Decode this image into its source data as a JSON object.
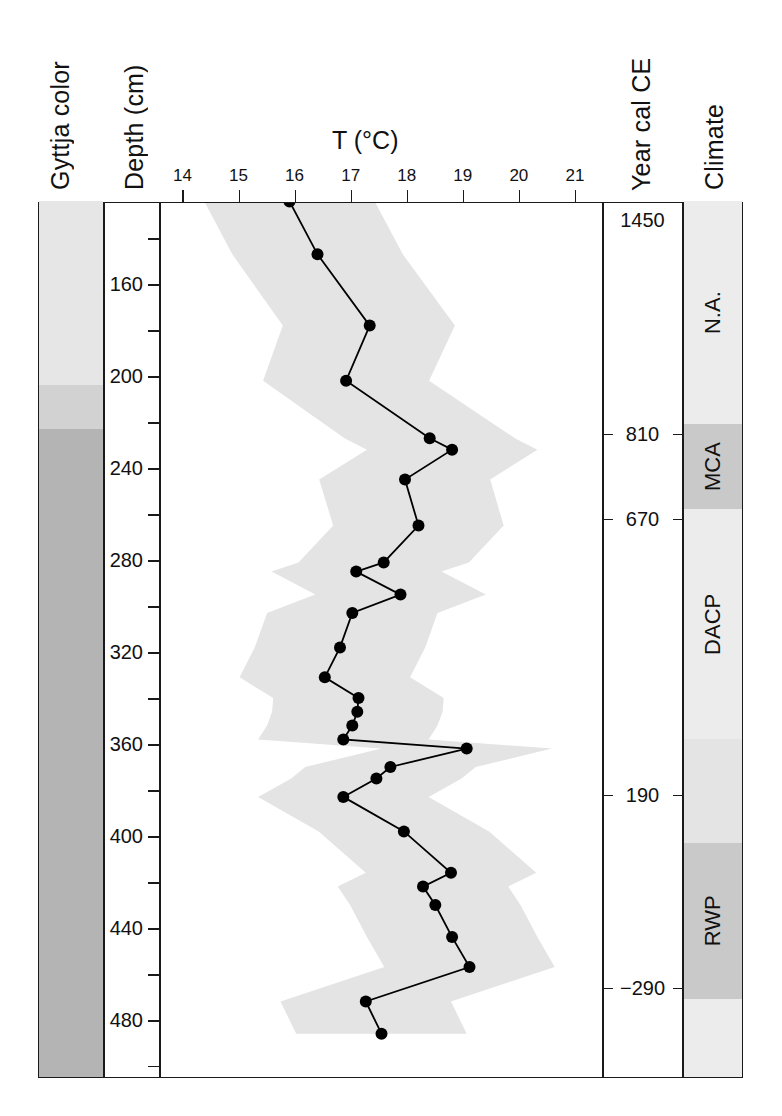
{
  "figure": {
    "columns": {
      "gyttja_header": "Gyttja color",
      "depth_header": "Depth (cm)",
      "temp_header": "T (°C)",
      "year_header": "Year cal CE",
      "climate_header": "Climate"
    },
    "colors": {
      "frame": "#1a1a1a",
      "curve": "#000000",
      "marker": "#000000",
      "uncertainty_band": "#e4e4e4",
      "gyttja_light": "#e6e6e6",
      "gyttja_medium": "#d2d2d2",
      "gyttja_dark": "#b4b4b4",
      "climate_light": "#ececec",
      "climate_dark": "#c9c9c9"
    },
    "gyttja_bands": [
      {
        "name": "upper-light-gyttja",
        "depth_top": 124,
        "depth_bottom": 204,
        "color": "#e6e6e6"
      },
      {
        "name": "transition-gyttja",
        "depth_top": 204,
        "depth_bottom": 223,
        "color": "#d2d2d2"
      },
      {
        "name": "lower-dark-gyttja",
        "depth_top": 223,
        "depth_bottom": 505,
        "color": "#b4b4b4"
      }
    ],
    "climate_bands": [
      {
        "label": "N.A.",
        "depth_top": 124,
        "depth_bottom": 221,
        "color": "#ececec"
      },
      {
        "label": "MCA",
        "depth_top": 221,
        "depth_bottom": 258,
        "color": "#c9c9c9"
      },
      {
        "label": "DACP",
        "depth_top": 258,
        "depth_bottom": 358,
        "color": "#ececec"
      },
      {
        "label": "",
        "depth_top": 358,
        "depth_bottom": 403,
        "color": "#e4e4e4"
      },
      {
        "label": "RWP",
        "depth_top": 403,
        "depth_bottom": 471,
        "color": "#c9c9c9"
      },
      {
        "label": "",
        "depth_top": 471,
        "depth_bottom": 505,
        "color": "#ececec"
      }
    ],
    "year_markers": [
      {
        "label": "1450",
        "depth": 132,
        "tick": false
      },
      {
        "label": "810",
        "depth": 225,
        "tick": true
      },
      {
        "label": "670",
        "depth": 262,
        "tick": true
      },
      {
        "label": "190",
        "depth": 382,
        "tick": true
      },
      {
        "label": "-290",
        "depth": 466,
        "tick": true
      }
    ]
  },
  "chart_data": {
    "type": "line",
    "title": "T (°C)",
    "xlabel": "T (°C)",
    "ylabel": "Depth (cm)",
    "xlim": [
      13.6,
      21.5
    ],
    "ylim": [
      505,
      124
    ],
    "y_inverted": true,
    "grid": false,
    "legend": null,
    "x_ticks": [
      14,
      15,
      16,
      17,
      18,
      19,
      20,
      21
    ],
    "x_tick_labels": [
      "14",
      "15",
      "16",
      "17",
      "18",
      "19",
      "20",
      "21"
    ],
    "y_ticks_major": [
      160,
      200,
      240,
      280,
      320,
      360,
      400,
      440,
      480
    ],
    "y_tick_labels": [
      "160",
      "200",
      "240",
      "280",
      "320",
      "360",
      "400",
      "440",
      "480"
    ],
    "y_ticks_minor": [
      140,
      180,
      220,
      260,
      300,
      340,
      380,
      420,
      460,
      500
    ],
    "series": [
      {
        "name": "Reconstructed temperature",
        "marker": "filled-circle",
        "points": [
          {
            "depth": 124,
            "T": 15.92
          },
          {
            "depth": 147,
            "T": 16.42
          },
          {
            "depth": 178,
            "T": 17.35
          },
          {
            "depth": 202,
            "T": 16.93
          },
          {
            "depth": 227,
            "T": 18.42
          },
          {
            "depth": 232,
            "T": 18.82
          },
          {
            "depth": 245,
            "T": 17.98
          },
          {
            "depth": 265,
            "T": 18.22
          },
          {
            "depth": 281,
            "T": 17.6
          },
          {
            "depth": 285,
            "T": 17.11
          },
          {
            "depth": 295,
            "T": 17.9
          },
          {
            "depth": 303,
            "T": 17.04
          },
          {
            "depth": 318,
            "T": 16.82
          },
          {
            "depth": 331,
            "T": 16.55
          },
          {
            "depth": 340,
            "T": 17.15
          },
          {
            "depth": 346,
            "T": 17.13
          },
          {
            "depth": 352,
            "T": 17.04
          },
          {
            "depth": 358,
            "T": 16.88
          },
          {
            "depth": 362,
            "T": 19.08
          },
          {
            "depth": 370,
            "T": 17.72
          },
          {
            "depth": 375,
            "T": 17.47
          },
          {
            "depth": 383,
            "T": 16.88
          },
          {
            "depth": 398,
            "T": 17.96
          },
          {
            "depth": 416,
            "T": 18.8
          },
          {
            "depth": 422,
            "T": 18.3
          },
          {
            "depth": 430,
            "T": 18.52
          },
          {
            "depth": 444,
            "T": 18.82
          },
          {
            "depth": 457,
            "T": 19.13
          },
          {
            "depth": 472,
            "T": 17.28
          },
          {
            "depth": 486,
            "T": 17.56
          }
        ]
      }
    ],
    "uncertainty_band": {
      "name": "Uncertainty envelope",
      "color": "#e4e4e4",
      "lower": [
        {
          "depth": 124,
          "T": 14.4
        },
        {
          "depth": 147,
          "T": 14.9
        },
        {
          "depth": 178,
          "T": 15.8
        },
        {
          "depth": 202,
          "T": 15.45
        },
        {
          "depth": 227,
          "T": 16.9
        },
        {
          "depth": 232,
          "T": 17.3
        },
        {
          "depth": 245,
          "T": 16.45
        },
        {
          "depth": 265,
          "T": 16.7
        },
        {
          "depth": 281,
          "T": 16.08
        },
        {
          "depth": 285,
          "T": 15.6
        },
        {
          "depth": 295,
          "T": 16.38
        },
        {
          "depth": 303,
          "T": 15.52
        },
        {
          "depth": 318,
          "T": 15.3
        },
        {
          "depth": 331,
          "T": 15.03
        },
        {
          "depth": 340,
          "T": 15.63
        },
        {
          "depth": 346,
          "T": 15.61
        },
        {
          "depth": 352,
          "T": 15.52
        },
        {
          "depth": 358,
          "T": 15.36
        },
        {
          "depth": 362,
          "T": 17.56
        },
        {
          "depth": 370,
          "T": 16.2
        },
        {
          "depth": 375,
          "T": 15.95
        },
        {
          "depth": 383,
          "T": 15.36
        },
        {
          "depth": 398,
          "T": 16.44
        },
        {
          "depth": 416,
          "T": 17.28
        },
        {
          "depth": 422,
          "T": 16.78
        },
        {
          "depth": 430,
          "T": 17.0
        },
        {
          "depth": 444,
          "T": 17.3
        },
        {
          "depth": 457,
          "T": 17.61
        },
        {
          "depth": 472,
          "T": 15.76
        },
        {
          "depth": 486,
          "T": 16.04
        }
      ],
      "upper": [
        {
          "depth": 124,
          "T": 17.44
        },
        {
          "depth": 147,
          "T": 17.94
        },
        {
          "depth": 178,
          "T": 18.87
        },
        {
          "depth": 202,
          "T": 18.41
        },
        {
          "depth": 227,
          "T": 19.94
        },
        {
          "depth": 232,
          "T": 20.34
        },
        {
          "depth": 245,
          "T": 19.5
        },
        {
          "depth": 265,
          "T": 19.74
        },
        {
          "depth": 281,
          "T": 19.12
        },
        {
          "depth": 285,
          "T": 18.63
        },
        {
          "depth": 295,
          "T": 19.42
        },
        {
          "depth": 303,
          "T": 18.56
        },
        {
          "depth": 318,
          "T": 18.34
        },
        {
          "depth": 331,
          "T": 18.07
        },
        {
          "depth": 340,
          "T": 18.67
        },
        {
          "depth": 346,
          "T": 18.65
        },
        {
          "depth": 352,
          "T": 18.56
        },
        {
          "depth": 358,
          "T": 18.4
        },
        {
          "depth": 362,
          "T": 20.6
        },
        {
          "depth": 370,
          "T": 19.24
        },
        {
          "depth": 375,
          "T": 18.99
        },
        {
          "depth": 383,
          "T": 18.4
        },
        {
          "depth": 398,
          "T": 19.48
        },
        {
          "depth": 416,
          "T": 20.32
        },
        {
          "depth": 422,
          "T": 19.82
        },
        {
          "depth": 430,
          "T": 20.04
        },
        {
          "depth": 444,
          "T": 20.34
        },
        {
          "depth": 457,
          "T": 20.65
        },
        {
          "depth": 472,
          "T": 18.8
        },
        {
          "depth": 486,
          "T": 19.08
        }
      ]
    }
  }
}
